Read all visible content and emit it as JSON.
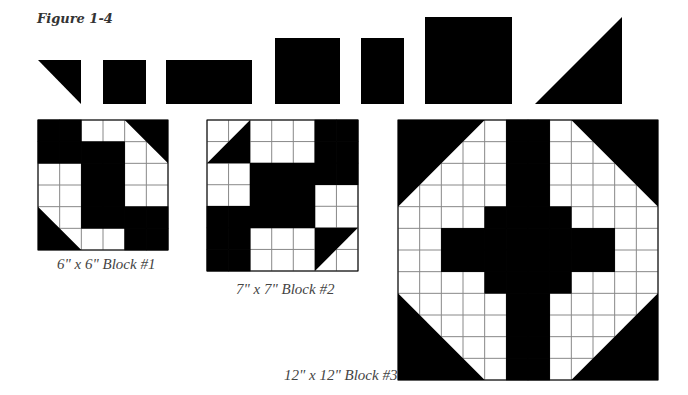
{
  "figure": {
    "title": "Figure 1-4"
  },
  "colors": {
    "fill": "#000000",
    "background": "#ffffff",
    "grid": "#888888",
    "label": "#444444"
  },
  "shapes": [
    {
      "name": "triangle-small",
      "type": "triangle",
      "x": 38,
      "y": 60,
      "w": 43,
      "h": 44,
      "points": "0,0 43,0 43,44"
    },
    {
      "name": "square-small",
      "type": "rect",
      "x": 103,
      "y": 60,
      "w": 43,
      "h": 44
    },
    {
      "name": "rectangle-wide",
      "type": "rect",
      "x": 166,
      "y": 60,
      "w": 86,
      "h": 44
    },
    {
      "name": "square-medium",
      "type": "rect",
      "x": 275,
      "y": 38,
      "w": 65,
      "h": 66
    },
    {
      "name": "rectangle-tall",
      "type": "rect",
      "x": 361,
      "y": 38,
      "w": 43,
      "h": 66
    },
    {
      "name": "square-large",
      "type": "rect",
      "x": 425,
      "y": 17,
      "w": 87,
      "h": 87
    },
    {
      "name": "triangle-large",
      "type": "triangle",
      "x": 535,
      "y": 17,
      "w": 87,
      "h": 87,
      "points": "87,0 87,87 0,87"
    }
  ],
  "blocks": [
    {
      "name": "block-1",
      "label": "6\" x 6\" Block #1",
      "x": 37,
      "y": 119,
      "size": 130,
      "n": 6,
      "label_x": 57,
      "label_y": 256,
      "grid": [
        "BBWWTT",
        "BBBBTT",
        "WWBBWW",
        "WWBBWW",
        "TTBBBB",
        "TTWWBB"
      ],
      "triangles": [
        {
          "points": "4,0 6,0 6,2"
        },
        {
          "points": "0,4 0,6 2,6"
        }
      ]
    },
    {
      "name": "block-2",
      "label": "7\" x 7\" Block #2",
      "x": 206,
      "y": 119,
      "size": 151,
      "n": 7,
      "label_x": 236,
      "label_y": 281,
      "grid": [
        "TTWWWBB",
        "TTWWWBB",
        "WWBBBBB",
        "WWBBBWW",
        "BBBBBWW",
        "BBWWWTT",
        "BBWWWTT"
      ],
      "triangles": [
        {
          "points": "2,0 2,2 0,2"
        },
        {
          "points": "5,5 7,5 5,7"
        }
      ]
    },
    {
      "name": "block-3",
      "label": "12\" x 12\" Block #3",
      "x": 397,
      "y": 119,
      "size": 260,
      "n": 12,
      "label_x": 284,
      "label_y": 367,
      "grid": [
        "TTTTWBBWTTTT",
        "TTTTWBBWTTTT",
        "TTTTWBBWTTTT",
        "TTTTWBBWTTTT",
        "WWWWBBBBWWWW",
        "WWBBBBBBBBWW",
        "WWBBBBBBBBWW",
        "WWWWBBBBWWWW",
        "TTTTWBBWTTTT",
        "TTTTWBBWTTTT",
        "TTTTWBBWTTTT",
        "TTTTWBBWTTTT"
      ],
      "triangles": [
        {
          "points": "0,0 4,0 0,4"
        },
        {
          "points": "8,0 12,0 12,4"
        },
        {
          "points": "0,8 0,12 4,12"
        },
        {
          "points": "12,8 12,12 8,12"
        }
      ]
    }
  ]
}
